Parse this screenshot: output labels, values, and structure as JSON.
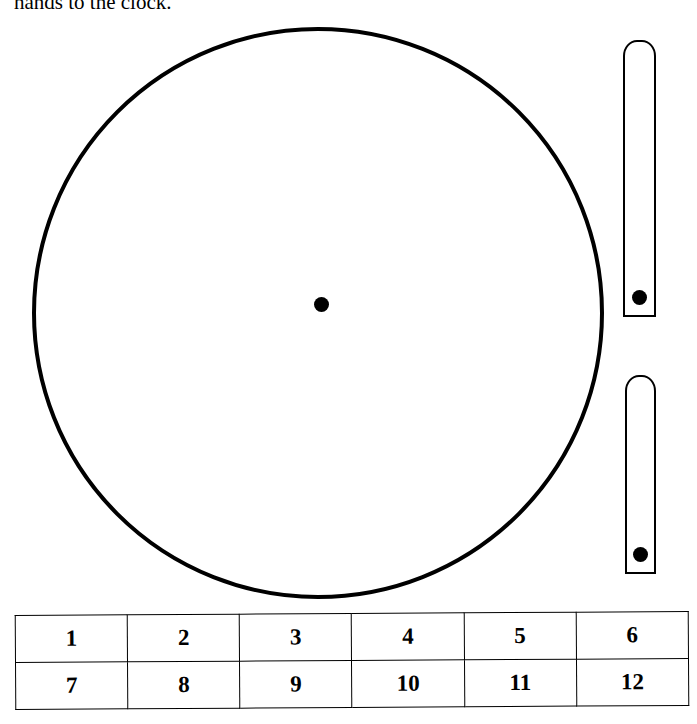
{
  "intro_text": "hands to the clock.",
  "clock_face": {
    "shape": "circle",
    "center_dot": true
  },
  "hands": [
    {
      "name": "minute-hand",
      "length": "long"
    },
    {
      "name": "hour-hand",
      "length": "short"
    }
  ],
  "number_table": {
    "rows": [
      [
        "1",
        "2",
        "3",
        "4",
        "5",
        "6"
      ],
      [
        "7",
        "8",
        "9",
        "10",
        "11",
        "12"
      ]
    ]
  }
}
